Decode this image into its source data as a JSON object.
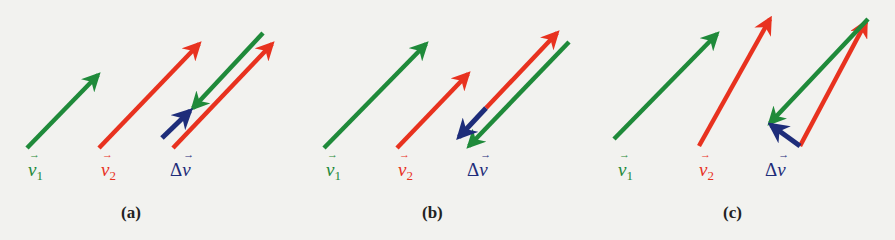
{
  "colors": {
    "v1": "#1f8a3a",
    "v2": "#e8321f",
    "delta_v": "#1e2d7a",
    "background": "#f2f2ef"
  },
  "labels": {
    "v1_symbol": "v",
    "v1_subscript": "1",
    "v2_symbol": "v",
    "v2_subscript": "2",
    "delta_prefix": "Δ",
    "delta_symbol": "v"
  },
  "panels": [
    {
      "caption": "(a)",
      "description": "v2 parallel and longer than v1; Δv = v2 − v1 points forward (along motion)",
      "arrows": {
        "v1": {
          "x1": 27,
          "y1": 148,
          "x2": 98,
          "y2": 75
        },
        "v2": {
          "x1": 99,
          "y1": 148,
          "x2": 199,
          "y2": 44
        },
        "group_neg_v1": {
          "x1": 263,
          "y1": 33,
          "x2": 193,
          "y2": 108
        },
        "group_delta_v": {
          "x1": 162,
          "y1": 138,
          "x2": 190,
          "y2": 111
        },
        "group_v2": {
          "x1": 173,
          "y1": 148,
          "x2": 272,
          "y2": 44
        }
      },
      "label_pos": {
        "v1": [
          28,
          160
        ],
        "v2": [
          101,
          160
        ],
        "dv": [
          170,
          160
        ],
        "caption": [
          121,
          203
        ]
      }
    },
    {
      "caption": "(b)",
      "description": "v2 parallel and shorter than v1; Δv points backward",
      "arrows": {
        "v1": {
          "x1": 324,
          "y1": 148,
          "x2": 426,
          "y2": 44
        },
        "v2": {
          "x1": 397,
          "y1": 148,
          "x2": 468,
          "y2": 74
        },
        "group_v2": {
          "x1": 486,
          "y1": 108,
          "x2": 557,
          "y2": 33
        },
        "group_delta_v": {
          "x1": 486,
          "y1": 108,
          "x2": 459,
          "y2": 137
        },
        "group_neg_v1": {
          "x1": 569,
          "y1": 42,
          "x2": 469,
          "y2": 146
        }
      },
      "label_pos": {
        "v1": [
          326,
          160
        ],
        "v2": [
          398,
          160
        ],
        "dv": [
          467,
          160
        ],
        "caption": [
          422,
          203
        ]
      }
    },
    {
      "caption": "(c)",
      "description": "v2 differs in direction from v1; Δv is the vector from tip of v1 to tip of v2",
      "arrows": {
        "v1": {
          "x1": 614,
          "y1": 139,
          "x2": 717,
          "y2": 34
        },
        "v2": {
          "x1": 699,
          "y1": 146,
          "x2": 770,
          "y2": 19
        },
        "group_neg_v1": {
          "x1": 868,
          "y1": 19,
          "x2": 770,
          "y2": 123
        },
        "group_v2": {
          "x1": 800,
          "y1": 146,
          "x2": 866,
          "y2": 22
        },
        "group_delta_v": {
          "x1": 800,
          "y1": 146,
          "x2": 771,
          "y2": 125
        }
      },
      "label_pos": {
        "v1": [
          618,
          160
        ],
        "v2": [
          699,
          160
        ],
        "dv": [
          765,
          160
        ],
        "caption": [
          723,
          203
        ]
      }
    }
  ]
}
